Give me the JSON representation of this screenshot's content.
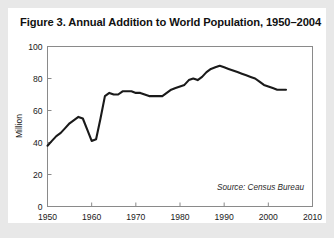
{
  "figure": {
    "title": "Figure 3. Annual Addition to World Population, 1950–2004",
    "source_note": "Source: Census Bureau"
  },
  "chart_data": {
    "type": "line",
    "title": "Figure 3. Annual Addition to World Population, 1950–2004",
    "xlabel": "",
    "ylabel": "Million",
    "xlim": [
      1950,
      2010
    ],
    "ylim": [
      0,
      100
    ],
    "xticks": [
      1950,
      1960,
      1970,
      1980,
      1990,
      2000,
      2010
    ],
    "xticklabels": [
      "1950",
      "1960",
      "1970",
      "1980",
      "1990",
      "2000",
      "2010"
    ],
    "yticks": [
      0,
      20,
      40,
      60,
      80,
      100
    ],
    "yticklabels": [
      "0",
      "20",
      "40",
      "60",
      "80",
      "100"
    ],
    "grid": false,
    "legend": false,
    "annotations": [
      "Source: Census Bureau"
    ],
    "line_color": "#1a1a1a",
    "series": [
      {
        "name": "Annual addition to world population",
        "x": [
          1950,
          1951,
          1952,
          1953,
          1954,
          1955,
          1956,
          1957,
          1958,
          1959,
          1960,
          1961,
          1962,
          1963,
          1964,
          1965,
          1966,
          1967,
          1968,
          1969,
          1970,
          1971,
          1972,
          1973,
          1974,
          1975,
          1976,
          1977,
          1978,
          1979,
          1980,
          1981,
          1982,
          1983,
          1984,
          1985,
          1986,
          1987,
          1988,
          1989,
          1990,
          1991,
          1992,
          1993,
          1994,
          1995,
          1996,
          1997,
          1998,
          1999,
          2000,
          2001,
          2002,
          2003,
          2004
        ],
        "values": [
          38,
          41,
          44,
          46,
          49,
          52,
          54,
          56,
          55,
          48,
          41,
          42,
          55,
          69,
          71,
          70,
          70,
          72,
          72,
          72,
          71,
          71,
          70,
          69,
          69,
          69,
          69,
          71,
          73,
          74,
          75,
          76,
          79,
          80,
          79,
          81,
          84,
          86,
          87,
          88,
          87,
          86,
          85,
          84,
          83,
          82,
          81,
          80,
          78,
          76,
          75,
          74,
          73,
          73,
          73
        ]
      }
    ]
  }
}
